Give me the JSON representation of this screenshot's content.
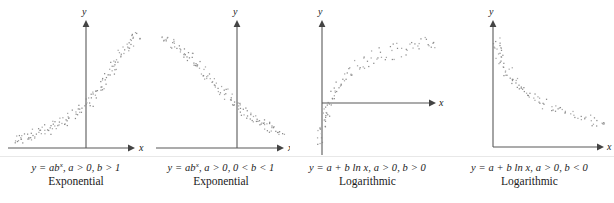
{
  "figure": {
    "background_color": "#ffffff",
    "axis_color": "#595959",
    "point_color": "#8c8c8c",
    "text_color": "#1a1a1a"
  },
  "panels": [
    {
      "id": "panel-exponential-growth",
      "equation_html": "y = ab<sup>x</sup>, a &gt; 0, b &gt; 1",
      "equation_text": "y = ab^x, a > 0, b > 1",
      "model_name": "Exponential",
      "x_axis_label": "x",
      "y_axis_label": "y",
      "shape": "increasing-convex"
    },
    {
      "id": "panel-exponential-decay",
      "equation_html": "y = ab<sup>x</sup>, a &gt; 0, 0 &lt; b &lt; 1",
      "equation_text": "y = ab^x, a > 0, 0 < b < 1",
      "model_name": "Exponential",
      "x_axis_label": "x",
      "y_axis_label": "y",
      "shape": "decreasing-convex"
    },
    {
      "id": "panel-logarithmic-increasing",
      "equation_html": "y = a + b ln x, a &gt; 0, b &gt; 0",
      "equation_text": "y = a + b ln x, a > 0, b > 0",
      "model_name": "Logarithmic",
      "x_axis_label": "x",
      "y_axis_label": "y",
      "shape": "increasing-concave"
    },
    {
      "id": "panel-logarithmic-decreasing",
      "equation_html": "y = a + b ln x, a &gt; 0, b &lt; 0",
      "equation_text": "y = a + b ln x, a > 0, b < 0",
      "model_name": "Logarithmic",
      "x_axis_label": "x",
      "y_axis_label": "y",
      "shape": "decreasing-concave"
    }
  ],
  "chart_data": [
    {
      "type": "scatter",
      "title": "Exponential",
      "annotation": "y = ab^x, a > 0, b > 1",
      "xlabel": "x",
      "ylabel": "y",
      "grid": false,
      "legend": "none",
      "axes": {
        "y_axis_x_px": 86,
        "x_axis_y_px": 148,
        "x_axis_from_px": 8,
        "x_axis_to_px": 131,
        "y_axis_top_px": 22
      },
      "n_points": 88,
      "trend": "increasing convex (exponential growth)",
      "xlim": [
        -2.6,
        2.6
      ],
      "ylim": [
        0,
        1
      ],
      "points": [
        [
          -2.55,
          0.055
        ],
        [
          -2.42,
          0.048
        ],
        [
          -2.34,
          0.072
        ],
        [
          -2.28,
          0.06
        ],
        [
          -2.18,
          0.082
        ],
        [
          -2.1,
          0.065
        ],
        [
          -2.02,
          0.09
        ],
        [
          -1.95,
          0.075
        ],
        [
          -1.86,
          0.1
        ],
        [
          -1.78,
          0.088
        ],
        [
          -1.7,
          0.112
        ],
        [
          -1.62,
          0.095
        ],
        [
          -1.54,
          0.122
        ],
        [
          -1.46,
          0.108
        ],
        [
          -1.38,
          0.135
        ],
        [
          -1.3,
          0.118
        ],
        [
          -1.22,
          0.148
        ],
        [
          -1.14,
          0.13
        ],
        [
          -1.06,
          0.16
        ],
        [
          -0.98,
          0.142
        ],
        [
          -0.9,
          0.175
        ],
        [
          -0.82,
          0.155
        ],
        [
          -0.74,
          0.19
        ],
        [
          -0.66,
          0.172
        ],
        [
          -0.58,
          0.205
        ],
        [
          -0.5,
          0.188
        ],
        [
          -0.42,
          0.222
        ],
        [
          -0.34,
          0.205
        ],
        [
          -0.26,
          0.245
        ],
        [
          -0.18,
          0.228
        ],
        [
          -0.1,
          0.268
        ],
        [
          -0.02,
          0.25
        ],
        [
          0.06,
          0.295
        ],
        [
          0.14,
          0.275
        ],
        [
          0.22,
          0.322
        ],
        [
          0.3,
          0.305
        ],
        [
          0.36,
          0.352
        ],
        [
          0.42,
          0.335
        ],
        [
          0.5,
          0.385
        ],
        [
          0.56,
          0.368
        ],
        [
          0.62,
          0.415
        ],
        [
          0.68,
          0.4
        ],
        [
          0.74,
          0.452
        ],
        [
          0.8,
          0.435
        ],
        [
          0.86,
          0.488
        ],
        [
          0.92,
          0.47
        ],
        [
          0.98,
          0.522
        ],
        [
          1.04,
          0.508
        ],
        [
          1.1,
          0.56
        ],
        [
          1.16,
          0.545
        ],
        [
          1.22,
          0.598
        ],
        [
          1.28,
          0.582
        ],
        [
          1.34,
          0.635
        ],
        [
          1.4,
          0.618
        ],
        [
          1.46,
          0.672
        ],
        [
          1.52,
          0.655
        ],
        [
          1.58,
          0.705
        ],
        [
          1.64,
          0.69
        ],
        [
          1.7,
          0.742
        ],
        [
          1.76,
          0.725
        ],
        [
          1.82,
          0.778
        ],
        [
          1.88,
          0.762
        ],
        [
          1.94,
          0.81
        ],
        [
          2.0,
          0.795
        ],
        [
          2.06,
          0.845
        ],
        [
          2.12,
          0.83
        ],
        [
          2.18,
          0.875
        ],
        [
          2.24,
          0.86
        ],
        [
          2.3,
          0.9
        ],
        [
          2.36,
          0.888
        ],
        [
          2.42,
          0.925
        ],
        [
          2.48,
          0.912
        ]
      ]
    },
    {
      "type": "scatter",
      "title": "Exponential",
      "annotation": "y = ab^x, a > 0, 0 < b < 1",
      "xlabel": "x",
      "ylabel": "y",
      "grid": false,
      "legend": "none",
      "axes": {
        "y_axis_x_px": 237,
        "x_axis_y_px": 148,
        "x_axis_from_px": 158,
        "x_axis_to_px": 283,
        "y_axis_top_px": 22
      },
      "n_points": 88,
      "trend": "decreasing convex (exponential decay)",
      "xlim": [
        -2.6,
        2.6
      ],
      "ylim": [
        0,
        1
      ],
      "points": [
        [
          -2.52,
          0.9
        ],
        [
          -2.44,
          0.925
        ],
        [
          -2.36,
          0.875
        ],
        [
          -2.28,
          0.9
        ],
        [
          -2.2,
          0.855
        ],
        [
          -2.12,
          0.878
        ],
        [
          -2.04,
          0.83
        ],
        [
          -1.96,
          0.852
        ],
        [
          -1.88,
          0.805
        ],
        [
          -1.8,
          0.828
        ],
        [
          -1.72,
          0.778
        ],
        [
          -1.64,
          0.8
        ],
        [
          -1.56,
          0.75
        ],
        [
          -1.48,
          0.772
        ],
        [
          -1.4,
          0.72
        ],
        [
          -1.32,
          0.742
        ],
        [
          -1.24,
          0.69
        ],
        [
          -1.16,
          0.712
        ],
        [
          -1.08,
          0.66
        ],
        [
          -1.0,
          0.68
        ],
        [
          -0.92,
          0.628
        ],
        [
          -0.84,
          0.648
        ],
        [
          -0.76,
          0.598
        ],
        [
          -0.68,
          0.618
        ],
        [
          -0.6,
          0.565
        ],
        [
          -0.52,
          0.585
        ],
        [
          -0.44,
          0.535
        ],
        [
          -0.36,
          0.552
        ],
        [
          -0.28,
          0.502
        ],
        [
          -0.2,
          0.52
        ],
        [
          -0.12,
          0.47
        ],
        [
          -0.04,
          0.488
        ],
        [
          0.04,
          0.44
        ],
        [
          0.12,
          0.455
        ],
        [
          0.2,
          0.408
        ],
        [
          0.28,
          0.425
        ],
        [
          0.36,
          0.378
        ],
        [
          0.44,
          0.395
        ],
        [
          0.52,
          0.35
        ],
        [
          0.6,
          0.365
        ],
        [
          0.68,
          0.322
        ],
        [
          0.76,
          0.338
        ],
        [
          0.84,
          0.295
        ],
        [
          0.92,
          0.31
        ],
        [
          1.0,
          0.272
        ],
        [
          1.08,
          0.285
        ],
        [
          1.16,
          0.25
        ],
        [
          1.24,
          0.262
        ],
        [
          1.32,
          0.228
        ],
        [
          1.4,
          0.24
        ],
        [
          1.48,
          0.208
        ],
        [
          1.56,
          0.22
        ],
        [
          1.64,
          0.19
        ],
        [
          1.72,
          0.2
        ],
        [
          1.8,
          0.172
        ],
        [
          1.88,
          0.182
        ],
        [
          1.96,
          0.155
        ],
        [
          2.04,
          0.165
        ],
        [
          2.12,
          0.142
        ],
        [
          2.2,
          0.15
        ],
        [
          2.28,
          0.128
        ],
        [
          2.36,
          0.135
        ],
        [
          2.44,
          0.115
        ],
        [
          2.52,
          0.122
        ]
      ]
    },
    {
      "type": "scatter",
      "title": "Logarithmic",
      "annotation": "y = a + b ln x, a > 0, b > 0",
      "xlabel": "x",
      "ylabel": "y",
      "grid": false,
      "legend": "none",
      "axes": {
        "y_axis_x_px": 322,
        "x_axis_y_px": 103,
        "x_axis_from_px": 322,
        "x_axis_to_px": 436,
        "y_axis_top_px": 22,
        "y_axis_bottom_px": 155
      },
      "n_points": 92,
      "trend": "increasing concave (logarithmic growth)",
      "xlim": [
        0,
        5.2
      ],
      "ylim": [
        -1,
        1.2
      ],
      "points": [
        [
          0.04,
          -0.85
        ],
        [
          0.06,
          -0.72
        ],
        [
          0.08,
          -0.62
        ],
        [
          0.1,
          -0.78
        ],
        [
          0.12,
          -0.55
        ],
        [
          0.14,
          -0.66
        ],
        [
          0.17,
          -0.45
        ],
        [
          0.2,
          -0.57
        ],
        [
          0.23,
          -0.36
        ],
        [
          0.26,
          -0.48
        ],
        [
          0.3,
          -0.26
        ],
        [
          0.34,
          -0.38
        ],
        [
          0.38,
          -0.15
        ],
        [
          0.43,
          -0.28
        ],
        [
          0.48,
          -0.05
        ],
        [
          0.53,
          -0.17
        ],
        [
          0.6,
          0.06
        ],
        [
          0.66,
          -0.06
        ],
        [
          0.73,
          0.16
        ],
        [
          0.8,
          0.05
        ],
        [
          0.88,
          0.26
        ],
        [
          0.96,
          0.15
        ],
        [
          1.05,
          0.34
        ],
        [
          1.14,
          0.24
        ],
        [
          1.24,
          0.42
        ],
        [
          1.34,
          0.32
        ],
        [
          1.45,
          0.5
        ],
        [
          1.56,
          0.4
        ],
        [
          1.68,
          0.56
        ],
        [
          1.8,
          0.47
        ],
        [
          1.93,
          0.62
        ],
        [
          2.06,
          0.53
        ],
        [
          2.2,
          0.68
        ],
        [
          2.34,
          0.59
        ],
        [
          2.48,
          0.73
        ],
        [
          2.63,
          0.64
        ],
        [
          2.78,
          0.78
        ],
        [
          2.94,
          0.69
        ],
        [
          3.1,
          0.82
        ],
        [
          3.26,
          0.73
        ],
        [
          3.42,
          0.86
        ],
        [
          3.58,
          0.77
        ],
        [
          3.75,
          0.9
        ],
        [
          3.92,
          0.81
        ],
        [
          4.08,
          0.93
        ],
        [
          4.25,
          0.85
        ],
        [
          4.42,
          0.96
        ],
        [
          4.58,
          0.88
        ],
        [
          4.72,
          0.99
        ],
        [
          4.86,
          0.91
        ],
        [
          4.98,
          1.01
        ],
        [
          5.08,
          0.94
        ]
      ]
    },
    {
      "type": "scatter",
      "title": "Logarithmic",
      "annotation": "y = a + b ln x, a > 0, b < 0",
      "xlabel": "x",
      "ylabel": "y",
      "grid": false,
      "legend": "none",
      "axes": {
        "y_axis_x_px": 493,
        "x_axis_y_px": 147,
        "x_axis_from_px": 493,
        "x_axis_to_px": 604,
        "y_axis_top_px": 22
      },
      "n_points": 96,
      "trend": "decreasing concave (negative logarithmic)",
      "xlim": [
        0,
        5.2
      ],
      "ylim": [
        0,
        1.1
      ],
      "points": [
        [
          0.05,
          1.0
        ],
        [
          0.07,
          0.93
        ],
        [
          0.09,
          0.97
        ],
        [
          0.11,
          0.88
        ],
        [
          0.14,
          0.92
        ],
        [
          0.17,
          0.84
        ],
        [
          0.2,
          0.88
        ],
        [
          0.24,
          0.79
        ],
        [
          0.28,
          0.83
        ],
        [
          0.33,
          0.74
        ],
        [
          0.38,
          0.78
        ],
        [
          0.44,
          0.7
        ],
        [
          0.5,
          0.74
        ],
        [
          0.57,
          0.66
        ],
        [
          0.64,
          0.7
        ],
        [
          0.72,
          0.62
        ],
        [
          0.8,
          0.65
        ],
        [
          0.89,
          0.58
        ],
        [
          0.98,
          0.61
        ],
        [
          1.08,
          0.54
        ],
        [
          1.18,
          0.57
        ],
        [
          1.29,
          0.5
        ],
        [
          1.4,
          0.53
        ],
        [
          1.52,
          0.47
        ],
        [
          1.64,
          0.5
        ],
        [
          1.77,
          0.44
        ],
        [
          1.9,
          0.46
        ],
        [
          2.04,
          0.41
        ],
        [
          2.18,
          0.43
        ],
        [
          2.33,
          0.38
        ],
        [
          2.48,
          0.4
        ],
        [
          2.64,
          0.35
        ],
        [
          2.8,
          0.37
        ],
        [
          2.96,
          0.33
        ],
        [
          3.13,
          0.35
        ],
        [
          3.3,
          0.3
        ],
        [
          3.47,
          0.32
        ],
        [
          3.65,
          0.28
        ],
        [
          3.83,
          0.3
        ],
        [
          4.0,
          0.26
        ],
        [
          4.18,
          0.28
        ],
        [
          4.36,
          0.24
        ],
        [
          4.54,
          0.26
        ],
        [
          4.7,
          0.22
        ],
        [
          4.86,
          0.24
        ],
        [
          5.0,
          0.2
        ],
        [
          5.1,
          0.22
        ],
        [
          5.16,
          0.18
        ]
      ]
    }
  ]
}
